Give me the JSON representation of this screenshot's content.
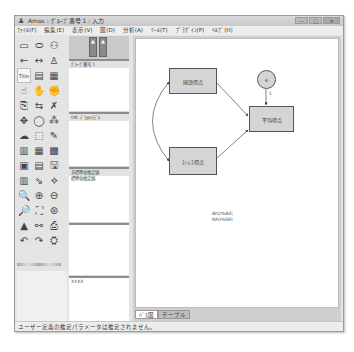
{
  "window": {
    "title": "Amos : ｸﾞﾙｰﾌﾟ番号 1 : 入力",
    "controls": {
      "minimize": "—",
      "maximize": "□",
      "close": "✕"
    }
  },
  "menu": [
    {
      "label": "ﾌｧｲﾙ(F)"
    },
    {
      "label": "編集(E)"
    },
    {
      "label": "表示(V)"
    },
    {
      "label": "図(D)"
    },
    {
      "label": "分析(A)"
    },
    {
      "label": "ﾂｰﾙ(T)"
    },
    {
      "label": "ﾌﾟﾗｸﾞｲﾝ(P)"
    },
    {
      "label": "ﾍﾙﾌﾟ(H)"
    }
  ],
  "toolbar": {
    "icons": [
      {
        "name": "draw-observed-variable-icon",
        "glyph": "▭"
      },
      {
        "name": "draw-unobserved-variable-icon",
        "glyph": "⬭"
      },
      {
        "name": "draw-latent-indicator-icon",
        "glyph": "⚇"
      },
      {
        "name": "draw-path-icon",
        "glyph": "←"
      },
      {
        "name": "draw-covariance-icon",
        "glyph": "↔"
      },
      {
        "name": "add-unique-variable-icon",
        "glyph": "♙"
      },
      {
        "name": "title-icon",
        "glyph": "Title"
      },
      {
        "name": "list-variables-in-model-icon",
        "glyph": "▤"
      },
      {
        "name": "list-variables-in-dataset-icon",
        "glyph": "▦"
      },
      {
        "name": "select-one-object-icon",
        "glyph": "☝"
      },
      {
        "name": "select-all-objects-icon",
        "glyph": "✋"
      },
      {
        "name": "deselect-all-objects-icon",
        "glyph": "✊"
      },
      {
        "name": "duplicate-objects-icon",
        "glyph": "⎘"
      },
      {
        "name": "move-objects-icon",
        "glyph": "⇆"
      },
      {
        "name": "erase-objects-icon",
        "glyph": "✗"
      },
      {
        "name": "change-shape-icon",
        "glyph": "✥"
      },
      {
        "name": "rotate-indicators-icon",
        "glyph": "◯"
      },
      {
        "name": "reflect-indicators-icon",
        "glyph": "⁂"
      },
      {
        "name": "move-parameter-values-icon",
        "glyph": "☁"
      },
      {
        "name": "scroll-diagram-icon",
        "glyph": "⬚"
      },
      {
        "name": "touch-up-variable-icon",
        "glyph": "✎"
      },
      {
        "name": "select-data-files-icon",
        "glyph": "▥"
      },
      {
        "name": "analysis-properties-icon",
        "glyph": "▦"
      },
      {
        "name": "calculate-estimates-icon",
        "glyph": "▩"
      },
      {
        "name": "copy-path-diagram-icon",
        "glyph": "▣"
      },
      {
        "name": "view-text-output-icon",
        "glyph": "▤"
      },
      {
        "name": "save-diagram-icon",
        "glyph": "🖫"
      },
      {
        "name": "object-properties-icon",
        "glyph": "▥"
      },
      {
        "name": "drag-properties-icon",
        "glyph": "⇘"
      },
      {
        "name": "preserve-symmetries-icon",
        "glyph": "⟡"
      },
      {
        "name": "zoom-select-icon",
        "glyph": "🔍"
      },
      {
        "name": "zoom-in-icon",
        "glyph": "⊕"
      },
      {
        "name": "zoom-out-icon",
        "glyph": "⊖"
      },
      {
        "name": "zoom-page-icon",
        "glyph": "🔎"
      },
      {
        "name": "fit-to-page-icon",
        "glyph": "⛶"
      },
      {
        "name": "loupe-icon",
        "glyph": "⊛"
      },
      {
        "name": "bayesian-estimation-icon",
        "glyph": "▲"
      },
      {
        "name": "multiple-group-analysis-icon",
        "glyph": "⚯"
      },
      {
        "name": "print-icon",
        "glyph": "⎙"
      },
      {
        "name": "undo-icon",
        "glyph": "↶"
      },
      {
        "name": "redo-icon",
        "glyph": "↷"
      },
      {
        "name": "specification-search-icon",
        "glyph": "⛭"
      }
    ]
  },
  "side_panels": {
    "groups": {
      "label": "ｸﾞﾙｰﾌﾟ番号 1"
    },
    "models": {
      "label": "OK: ﾃﾞﾌｫﾙﾄﾓﾃﾞﾙ"
    },
    "parameter_formats": {
      "items": [
        "非標準化推定値",
        "標準化推定値"
      ]
    },
    "computation_summary": {
      "label": ""
    },
    "notes": {
      "label": "XXXX"
    }
  },
  "diagram": {
    "nodes": [
      {
        "id": "x1",
        "label": "国語得点"
      },
      {
        "id": "x2",
        "label": "ｽﾄﾚｽ得点"
      },
      {
        "id": "y",
        "label": "平均得点"
      }
    ],
    "error_node": {
      "label": "e"
    },
    "error_path_label": "1",
    "fit_text": [
      "AIC/%AIC",
      "GFI/%GFI"
    ]
  },
  "tabs": [
    {
      "label": "ﾊﾟｽ図",
      "active": true
    },
    {
      "label": "テーブル",
      "active": false
    }
  ],
  "status": {
    "text": "ユーザー定義の推定パラメータは推定されません。"
  }
}
